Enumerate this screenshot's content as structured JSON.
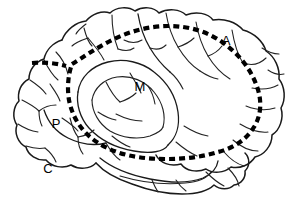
{
  "figure": {
    "background_color": "#ffffff",
    "line_color": "#1a1a1a",
    "dashed_line_color": "#000000",
    "width": 302,
    "height": 208,
    "view": "left lateral hemisphere, anterior to the right"
  },
  "labels": {
    "a": {
      "text": "A",
      "x": 226,
      "y": 45
    },
    "m": {
      "text": "M",
      "x": 140,
      "y": 91
    },
    "p": {
      "text": "P",
      "x": 56,
      "y": 128
    },
    "c": {
      "text": "C",
      "x": 48,
      "y": 173
    }
  },
  "annotations": {
    "dashed_outline_name": "dashed-region-outline",
    "dashed_segment_name": "dashed-segment-upper-left",
    "dash_length_px": 6,
    "dash_gap_px": 4,
    "dash_stroke_width_px": 4.2
  }
}
